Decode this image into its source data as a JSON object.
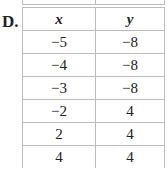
{
  "option_label": "D.",
  "table": {
    "headers": [
      "x",
      "y"
    ],
    "rows": [
      [
        "−5",
        "−8"
      ],
      [
        "−4",
        "−8"
      ],
      [
        "−3",
        "−8"
      ],
      [
        "−2",
        "4"
      ],
      [
        "2",
        "4"
      ],
      [
        "4",
        "4"
      ]
    ]
  }
}
